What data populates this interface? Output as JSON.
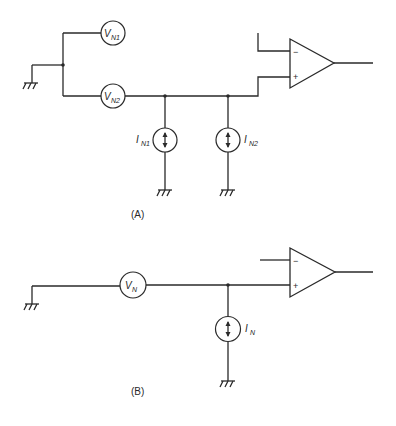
{
  "diagram_a": {
    "caption": "(A)",
    "voltage_sources": [
      {
        "label": "V",
        "subscript": "N1"
      },
      {
        "label": "V",
        "subscript": "N2"
      }
    ],
    "current_sources": [
      {
        "label": "I",
        "subscript": "N1"
      },
      {
        "label": "I",
        "subscript": "N2"
      }
    ],
    "opamp": {
      "inverting": "−",
      "noninverting": "+"
    },
    "wire_colors": {
      "top_wire_start": "#7a2a7a",
      "top_wire_end": "#4aa84a"
    }
  },
  "diagram_b": {
    "caption": "(B)",
    "voltage_source": {
      "label": "V",
      "subscript": "N"
    },
    "current_source": {
      "label": "I",
      "subscript": "N"
    },
    "opamp": {
      "inverting": "−",
      "noninverting": "+"
    }
  }
}
